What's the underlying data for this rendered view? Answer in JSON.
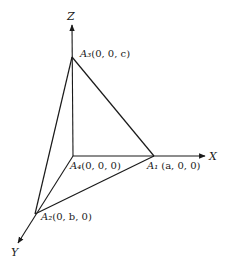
{
  "diagram": {
    "type": "3d-coordinate-tetrahedron",
    "axes": {
      "x": {
        "label": "X"
      },
      "y": {
        "label": "Y"
      },
      "z": {
        "label": "Z"
      }
    },
    "points": {
      "A1": {
        "name": "A₁",
        "coords": "(a, 0, 0)"
      },
      "A2": {
        "name": "A₂",
        "coords": "(0, b, 0)"
      },
      "A3": {
        "name": "A₃",
        "coords": "(0, 0, c)"
      },
      "A4": {
        "name": "A₄",
        "coords": "(0, 0, 0)"
      }
    },
    "edges": [
      [
        "A1",
        "A3"
      ],
      [
        "A2",
        "A3"
      ],
      [
        "A1",
        "A2"
      ],
      [
        "A4",
        "A1"
      ],
      [
        "A4",
        "A2"
      ],
      [
        "A4",
        "A3"
      ]
    ],
    "colors": {
      "line": "#1a1a1a",
      "background": "#ffffff"
    }
  }
}
